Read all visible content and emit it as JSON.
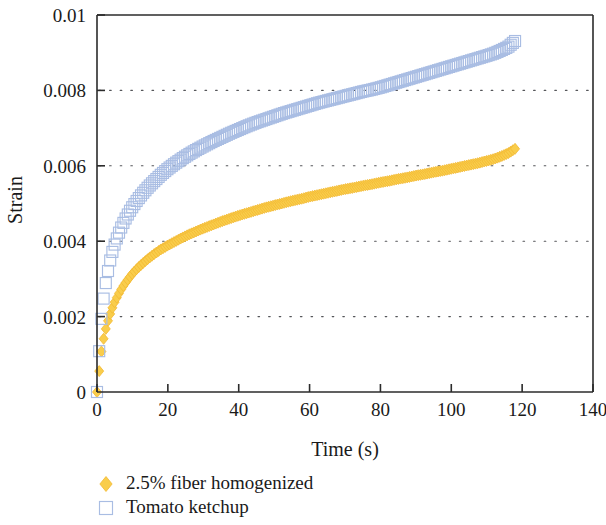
{
  "figure": {
    "background_color": "#ffffff",
    "axis_color": "#2b2b2b",
    "grid_color": "#55565a"
  },
  "chart_data": {
    "type": "scatter",
    "title": "",
    "subtitle": "",
    "xlabel": "Time (s)",
    "ylabel": "Strain",
    "xlim": [
      0,
      140
    ],
    "ylim": [
      0,
      0.01
    ],
    "xticks": [
      0,
      20,
      40,
      60,
      80,
      100,
      120,
      140
    ],
    "xtick_labels": [
      "0",
      "20",
      "40",
      "60",
      "80",
      "100",
      "120",
      "140"
    ],
    "yticks": [
      0,
      0.002,
      0.004,
      0.006,
      0.008,
      0.01
    ],
    "ytick_labels": [
      "0",
      "0.002",
      "0.004",
      "0.006",
      "0.008",
      "0.01"
    ],
    "grid": "horizontal-dotted",
    "grid_on": true,
    "legend_position": "below-left",
    "series": [
      {
        "name": "2.5% fiber homogenized",
        "color": "#F9CD4B",
        "edge_color": "#F2B933",
        "marker": "filled-diamond",
        "marker_size": 11,
        "x": [
          0,
          0.4,
          0.8,
          1.2,
          1.6,
          2,
          2.6,
          3.2,
          4,
          5,
          6,
          7,
          8,
          9,
          10,
          11.5,
          13,
          14.5,
          16,
          18,
          20,
          22,
          24,
          26,
          28,
          30,
          32.5,
          35,
          37.5,
          40,
          42.5,
          45,
          47.5,
          50,
          52.5,
          55,
          57.5,
          60,
          62.5,
          65,
          67.5,
          70,
          72.5,
          75,
          77.5,
          80,
          82.5,
          85,
          87.5,
          90,
          92.5,
          95,
          97.5,
          100,
          102.5,
          105,
          107.5,
          110,
          112,
          114,
          116,
          118
        ],
        "y": [
          0,
          0.00035,
          0.00072,
          0.00105,
          0.00128,
          0.00148,
          0.00172,
          0.00192,
          0.00215,
          0.00239,
          0.00258,
          0.00275,
          0.00289,
          0.00302,
          0.00314,
          0.00329,
          0.00342,
          0.00354,
          0.00365,
          0.00378,
          0.00389,
          0.00399,
          0.00409,
          0.00418,
          0.00426,
          0.00434,
          0.00443,
          0.00452,
          0.0046,
          0.00468,
          0.00475,
          0.00482,
          0.00489,
          0.00495,
          0.00501,
          0.00507,
          0.00512,
          0.00518,
          0.00523,
          0.00528,
          0.00533,
          0.00538,
          0.00542,
          0.00547,
          0.00551,
          0.00556,
          0.0056,
          0.00565,
          0.00569,
          0.00574,
          0.00578,
          0.00583,
          0.00587,
          0.00592,
          0.00597,
          0.00602,
          0.00607,
          0.00613,
          0.00618,
          0.00625,
          0.00633,
          0.00645
        ]
      },
      {
        "name": "Tomato ketchup",
        "color": "#ffffff",
        "edge_color": "#A9BDE3",
        "marker": "open-square",
        "marker_size": 11,
        "x": [
          0,
          0.3,
          0.6,
          0.9,
          1.2,
          1.6,
          2,
          2.5,
          3,
          3.6,
          4.2,
          5,
          6,
          7,
          8,
          9,
          10,
          11.5,
          13,
          14.5,
          16,
          18,
          20,
          22,
          24,
          26,
          28,
          30,
          32.5,
          35,
          37.5,
          40,
          42.5,
          45,
          47.5,
          50,
          52.5,
          55,
          57.5,
          60,
          62.5,
          65,
          67.5,
          70,
          72.5,
          75,
          77.5,
          80,
          82.5,
          85,
          87.5,
          90,
          92.5,
          95,
          97.5,
          100,
          102.5,
          105,
          107.5,
          110,
          112,
          114,
          116,
          118
        ],
        "y": [
          0,
          0.00052,
          0.00105,
          0.00152,
          0.0019,
          0.00228,
          0.00258,
          0.0029,
          0.00316,
          0.00344,
          0.00367,
          0.00392,
          0.00418,
          0.0044,
          0.00459,
          0.00476,
          0.00491,
          0.00511,
          0.00528,
          0.00544,
          0.00558,
          0.00576,
          0.00592,
          0.00606,
          0.00619,
          0.00631,
          0.00642,
          0.00652,
          0.00664,
          0.00675,
          0.00686,
          0.00696,
          0.00706,
          0.00715,
          0.00723,
          0.00731,
          0.00739,
          0.00746,
          0.00753,
          0.0076,
          0.00767,
          0.00773,
          0.00779,
          0.00785,
          0.00791,
          0.00797,
          0.00802,
          0.00808,
          0.00815,
          0.00822,
          0.00829,
          0.00836,
          0.00843,
          0.0085,
          0.00857,
          0.00864,
          0.00871,
          0.00878,
          0.00885,
          0.00892,
          0.00898,
          0.00906,
          0.00915,
          0.00931
        ]
      }
    ],
    "legend": [
      {
        "label": "2.5% fiber homogenized",
        "marker": "filled-diamond",
        "color": "#F9CD4B"
      },
      {
        "label": "Tomato ketchup",
        "marker": "open-square",
        "color": "#A9BDE3"
      }
    ]
  }
}
